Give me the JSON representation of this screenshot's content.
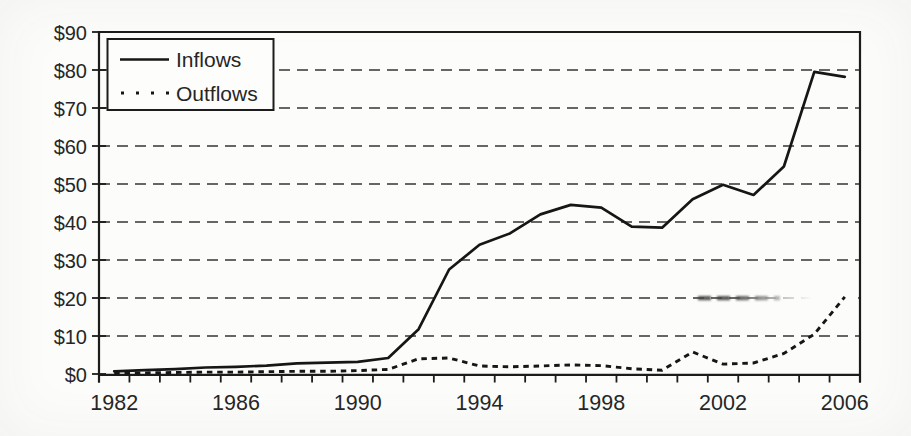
{
  "figure": {
    "background": "#fcfcfa",
    "ink_color": "#1c1c1c"
  },
  "chart_data": {
    "type": "line",
    "title": "",
    "xlabel": "",
    "ylabel": "",
    "x": [
      1982,
      1983,
      1984,
      1985,
      1986,
      1987,
      1988,
      1989,
      1990,
      1991,
      1992,
      1993,
      1994,
      1995,
      1996,
      1997,
      1998,
      1999,
      2000,
      2001,
      2002,
      2003,
      2004,
      2005,
      2006
    ],
    "series": [
      {
        "name": "Inflows",
        "line_style": "solid",
        "color": "#161616",
        "values": [
          0.7,
          1.0,
          1.3,
          1.7,
          1.9,
          2.2,
          2.8,
          3.0,
          3.2,
          4.2,
          11.8,
          27.5,
          34.0,
          37.0,
          42.0,
          44.5,
          43.8,
          38.8,
          38.5,
          46.0,
          49.8,
          47.1,
          54.6,
          79.5,
          78.2
        ]
      },
      {
        "name": "Outflows",
        "line_style": "dotted",
        "color": "#161616",
        "values": [
          0.2,
          0.3,
          0.4,
          0.5,
          0.5,
          0.6,
          0.7,
          0.7,
          0.9,
          1.2,
          4.0,
          4.2,
          2.1,
          1.9,
          2.1,
          2.4,
          2.2,
          1.4,
          1.0,
          5.8,
          2.6,
          2.9,
          5.4,
          10.5,
          20.3
        ]
      }
    ],
    "ylim": [
      0,
      90
    ],
    "ytick_labels": [
      "$0",
      "$10",
      "$20",
      "$30",
      "$40",
      "$50",
      "$60",
      "$70",
      "$80",
      "$90"
    ],
    "xtick_labeled_years": [
      1982,
      1986,
      1990,
      1994,
      1998,
      2002,
      2006
    ],
    "grid": "horizontal dashed",
    "legend_position": "top-left",
    "artifact_note": "the $20 gridline is smudged darker near 2001-2003 and fades out toward the right edge"
  }
}
